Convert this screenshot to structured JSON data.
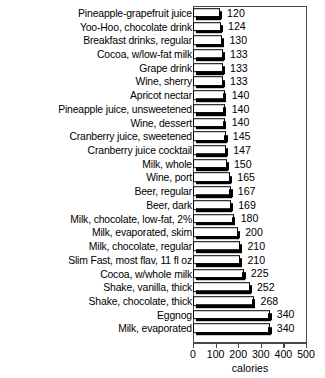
{
  "chart_data": {
    "type": "bar",
    "orientation": "horizontal",
    "title": "",
    "xlabel": "calories",
    "ylabel": "",
    "xlim": [
      0,
      500
    ],
    "xticks": [
      0,
      100,
      200,
      300,
      400,
      500
    ],
    "xtick_labels": [
      "0",
      "100",
      "200",
      "300",
      "400",
      "500"
    ],
    "grid": false,
    "legend": "none",
    "bar_style": "white fill, black outline, black 3D drop shadow",
    "categories": [
      "Pineapple-grapefruit juice",
      "Yoo-Hoo, chocolate drink",
      "Breakfast drinks, regular",
      "Cocoa, w/low-fat milk",
      "Grape drink",
      "Wine, sherry",
      "Apricot nectar",
      "Pineapple juice, unsweetened",
      "Wine, dessert",
      "Cranberry juice, sweetened",
      "Cranberry juice cocktail",
      "Milk, whole",
      "Wine, port",
      "Beer, regular",
      "Beer, dark",
      "Milk, chocolate, low-fat, 2%",
      "Milk, evaporated, skim",
      "Milk, chocolate, regular",
      "Slim Fast, most flav, 11 fl oz",
      "Cocoa, w/whole milk",
      "Shake, vanilla, thick",
      "Shake, chocolate, thick",
      "Eggnog",
      "Milk, evaporated"
    ],
    "values": [
      120,
      124,
      130,
      133,
      133,
      133,
      140,
      140,
      140,
      145,
      147,
      150,
      165,
      167,
      169,
      180,
      200,
      210,
      210,
      225,
      252,
      268,
      340,
      340
    ],
    "value_labels": [
      "120",
      "124",
      "130",
      "133",
      "133",
      "133",
      "140",
      "140",
      "140",
      "145",
      "147",
      "150",
      "165",
      "167",
      "169",
      "180",
      "200",
      "210",
      "210",
      "225",
      "252",
      "268",
      "340",
      "340"
    ]
  },
  "colors": {
    "bar_fill": "#ffffff",
    "bar_outline": "#000000",
    "bar_shadow": "#000000",
    "frame": "#4a4a4a",
    "text": "#000000",
    "background": "#ffffff"
  }
}
